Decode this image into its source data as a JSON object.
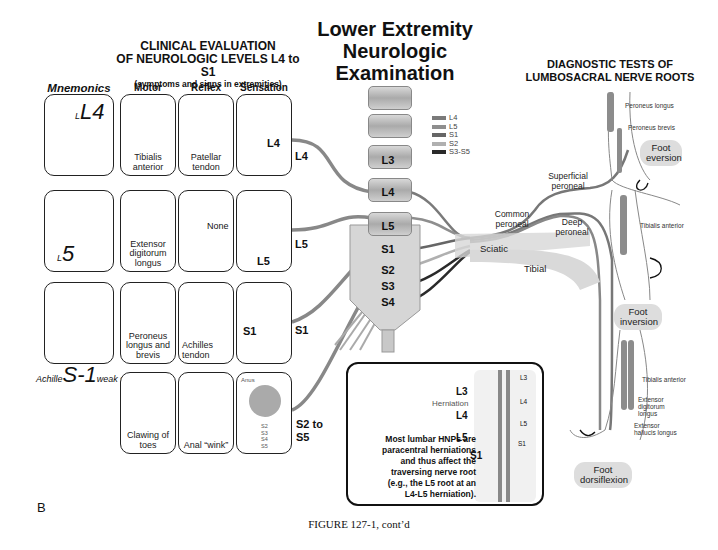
{
  "titles": {
    "main": [
      "Lower Extremity",
      "Neurologic",
      "Examination"
    ],
    "left": [
      "CLINICAL EVALUATION",
      "OF NEUROLOGIC LEVELS L4 to S1"
    ],
    "left_sub": "(symptoms and signs in extremities)",
    "right": [
      "DIAGNOSTIC TESTS OF",
      "LUMBOSACRAL NERVE ROOTS"
    ]
  },
  "columns": {
    "mnemonics": "Mnemonics",
    "motor": "Motor",
    "reflex": "Reflex",
    "sensation": "Sensation"
  },
  "rows": [
    {
      "level": "L4",
      "mnemonic": "L4",
      "motor": "Tibialis anterior",
      "reflex": "Patellar tendon",
      "sensation_label": "L4",
      "sensation_regions": [
        "S1",
        "L5"
      ]
    },
    {
      "level": "L5",
      "mnemonic": "L5",
      "motor": "Extensor digitorum longus",
      "reflex": "None",
      "sensation_label": "L5",
      "sensation_regions": [
        "L4",
        "S1"
      ]
    },
    {
      "level": "S1",
      "mnemonic": "S-1",
      "mnemonic_caption_left": "Achille",
      "mnemonic_caption_right": "weak spot",
      "motor": "Peroneus longus and brevis",
      "reflex": "Achilles tendon",
      "sensation_label": "S1",
      "sensation_regions": [
        "L4",
        "L5"
      ]
    },
    {
      "level": "S2 to S5",
      "motor": "Clawing of toes",
      "reflex": "Anal “wink”",
      "sensation_anus_label": "Anus",
      "sensation_regions": [
        "S2",
        "S3",
        "S4",
        "S5"
      ]
    }
  ],
  "legend": [
    {
      "label": "L4",
      "color": "#7a7a7a"
    },
    {
      "label": "L5",
      "color": "#8e8e8e"
    },
    {
      "label": "S1",
      "color": "#666666"
    },
    {
      "label": "S2",
      "color": "#b0b0b0"
    },
    {
      "label": "S3-S5",
      "color": "#2a2a2a"
    }
  ],
  "vertebrae": [
    "L3",
    "L4",
    "L5",
    "S1",
    "S2",
    "S3",
    "S4"
  ],
  "nerves": {
    "superficial_peroneal": "Superficial peroneal",
    "common_peroneal": "Common peroneal",
    "deep_peroneal": "Deep peroneal",
    "sciatic": "Sciatic",
    "tibial": "Tibial"
  },
  "diagnostic_tests": [
    {
      "test": "Foot eversion",
      "muscles": [
        "Peroneus longus",
        "Peroneus brevis"
      ]
    },
    {
      "test": "Foot inversion",
      "muscles": [
        "Tibialis anterior"
      ]
    },
    {
      "test": "Foot dorsiflexion",
      "muscles": [
        "Tibialis anterior",
        "Extensor digitorum longus",
        "Extensor hallucis longus"
      ]
    }
  ],
  "hnp_box": {
    "levels_left": [
      "L3",
      "L4",
      "L5",
      "S1"
    ],
    "levels_right": [
      "L3",
      "L4",
      "L5",
      "S1"
    ],
    "herniation_label": "Herniation",
    "text": [
      "Most lumbar HNPs are",
      "paracentral herniations",
      "and thus affect the",
      "traversing nerve root",
      "(e.g., the L5 root at an",
      "L4-L5 herniation)."
    ]
  },
  "panel_label": "B",
  "figure_caption": "FIGURE 127-1, cont’d"
}
